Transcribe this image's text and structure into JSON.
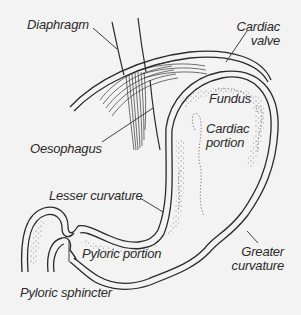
{
  "figure": {
    "top_cropped_text": "",
    "colors": {
      "background": "#f3f3f3",
      "ink": "#2a2a2a"
    },
    "labels": {
      "diaphragm": "Diaphragm",
      "cardiac_valve_line1": "Cardiac",
      "cardiac_valve_line2": "valve",
      "fundus": "Fundus",
      "oesophagus": "Oesophagus",
      "cardiac_portion_line1": "Cardiac",
      "cardiac_portion_line2": "portion",
      "lesser_curvature": "Lesser curvature",
      "pyloric_portion": "Pyloric portion",
      "greater_curvature_line1": "Greater",
      "greater_curvature_line2": "curvature",
      "pyloric_sphincter": "Pyloric sphincter"
    }
  }
}
